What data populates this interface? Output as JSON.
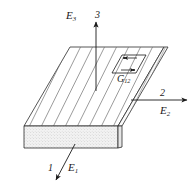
{
  "figure": {
    "type": "engineering-diagram",
    "background_color": "#ffffff",
    "line_color": "#1a1a1a",
    "fiber_line_color": "#6e6e6e",
    "front_face_fill": "#efefef",
    "side_face_fill": "#f7f7f7",
    "top_face_fill": "#ffffff"
  },
  "axes": [
    {
      "id": "axis-3",
      "number": "3",
      "modulus": "E",
      "modulus_subscript": "3",
      "direction": "up",
      "description": "through-thickness axis, vertical arrow above slab"
    },
    {
      "id": "axis-2",
      "number": "2",
      "modulus": "E",
      "modulus_subscript": "2",
      "direction": "right",
      "description": "transverse in-plane axis, horizontal arrow to the right"
    },
    {
      "id": "axis-1",
      "number": "1",
      "modulus": "E",
      "modulus_subscript": "1",
      "direction": "down-left",
      "description": "fiber direction axis, arrow toward lower left"
    }
  ],
  "shear": {
    "id": "shear-element",
    "symbol": "G",
    "subscript": "12",
    "description": "small sheared parallelogram element on top face with opposing arrow pair"
  },
  "fibers": {
    "count_top": 12,
    "orientation": "parallel diagonal lines running along the 1-direction"
  }
}
